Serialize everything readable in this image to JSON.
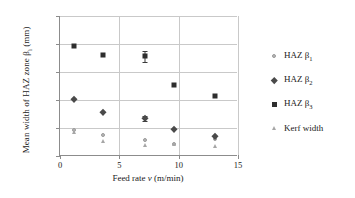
{
  "chart_data": {
    "type": "scatter",
    "title": "",
    "xlabel": "Feed rate v (m/min)",
    "ylabel": "Mean width of HAZ zone βi (mm)",
    "ylabel_main": "Mean width of HAZ zone β",
    "ylabel_sub": "i",
    "ylabel_unit": " (mm)",
    "xlabel_pre": "Feed rate ",
    "xlabel_var": "v",
    "xlabel_post": " (m/min)",
    "xlim": [
      0,
      15
    ],
    "ylim": [
      0,
      2.5
    ],
    "xticks": [
      "0",
      "5",
      "10",
      "15"
    ],
    "xtick_values": [
      0,
      5,
      10,
      15
    ],
    "yticks": [
      "0",
      "0.5",
      "1.0",
      "1.5",
      "2.0",
      "2.5"
    ],
    "ytick_values": [
      0,
      0.5,
      1.0,
      1.5,
      2.0,
      2.5
    ],
    "grid": "horizontal-and-vertical",
    "legend_position": "right",
    "x": [
      1.2,
      3.6,
      7.2,
      9.6,
      13.1
    ],
    "series": [
      {
        "name": "HAZ β1",
        "label_main": "HAZ β",
        "label_sub": "1",
        "marker": "circle",
        "color": "#b9b9b9",
        "values": [
          0.47,
          0.38,
          0.29,
          0.21,
          0.3
        ],
        "errors": [
          0,
          0,
          0,
          0,
          0
        ]
      },
      {
        "name": "HAZ β2",
        "label_main": "HAZ β",
        "label_sub": "2",
        "marker": "diamond",
        "color": "#4a4a4a",
        "values": [
          1.01,
          0.79,
          0.67,
          0.48,
          0.35
        ],
        "errors": [
          0,
          0,
          0.04,
          0,
          0
        ]
      },
      {
        "name": "HAZ β3",
        "label_main": "HAZ β",
        "label_sub": "3",
        "marker": "square",
        "color": "#2e2e2e",
        "values": [
          1.97,
          1.81,
          1.78,
          1.26,
          1.08
        ],
        "errors": [
          0,
          0,
          0.1,
          0,
          0
        ]
      },
      {
        "name": "Kerf width",
        "label_main": "Kerf width",
        "label_sub": "",
        "marker": "triangle",
        "color": "#a6a6a6",
        "values": [
          0.42,
          0.27,
          0.2,
          0.21,
          0.17
        ],
        "errors": [
          0,
          0,
          0,
          0,
          0
        ]
      }
    ]
  }
}
